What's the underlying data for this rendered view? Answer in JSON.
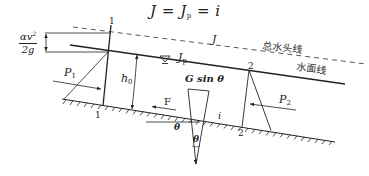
{
  "title": {
    "equation_J": "J",
    "eq1": "=",
    "equation_J_main": "J",
    "equation_J_sub": "p",
    "eq2": "=",
    "equation_i": "i"
  },
  "labels": {
    "velocity_head_num": "αv",
    "velocity_head_exp": "2",
    "velocity_head_den": "2g",
    "section_1_top": "1",
    "section_1_bottom": "1",
    "section_2_top": "2",
    "section_2_bottom": "2",
    "energy_slope": "J",
    "water_slope_main": "J",
    "water_slope_sub": "p",
    "total_head_line": "总水头线",
    "water_surface_line": "水面线",
    "pressure_1_main": "P",
    "pressure_1_sub": "1",
    "pressure_2_main": "P",
    "pressure_2_sub": "2",
    "depth_main": "h",
    "depth_sub": "0",
    "gravity_component": "G sin θ",
    "friction_force": "F",
    "bed_slope": "i",
    "angle_outer": "θ",
    "angle_inner": "θ",
    "water_surface_symbol": "▽"
  },
  "colors": {
    "line": "#222222",
    "dashed": "#444444",
    "background": "#ffffff"
  }
}
